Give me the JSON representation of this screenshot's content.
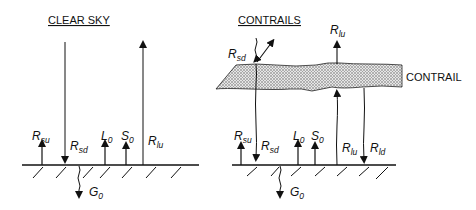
{
  "panels": {
    "clear_sky": {
      "title": "CLEAR SKY",
      "labels": {
        "rsu": {
          "main": "R",
          "sub": "su"
        },
        "rsd": {
          "main": "R",
          "sub": "sd"
        },
        "l0": {
          "main": "L",
          "sub": "0"
        },
        "s0": {
          "main": "S",
          "sub": "0"
        },
        "rlu": {
          "main": "R",
          "sub": "lu"
        },
        "g0": {
          "main": "G",
          "sub": "0"
        }
      }
    },
    "contrails": {
      "title": "CONTRAILS",
      "layer_label": "CONTRAIL",
      "labels": {
        "rsd_top": {
          "main": "R",
          "sub": "sd"
        },
        "rlu_top": {
          "main": "R",
          "sub": "lu"
        },
        "rsu": {
          "main": "R",
          "sub": "su"
        },
        "rsd": {
          "main": "R",
          "sub": "sd"
        },
        "l0": {
          "main": "L",
          "sub": "0"
        },
        "s0": {
          "main": "S",
          "sub": "0"
        },
        "rlu": {
          "main": "R",
          "sub": "lu"
        },
        "rld": {
          "main": "R",
          "sub": "ld"
        },
        "g0": {
          "main": "G",
          "sub": "0"
        }
      }
    }
  },
  "colors": {
    "ink": "#111111",
    "contrail_fill": "#cfcfcf"
  }
}
